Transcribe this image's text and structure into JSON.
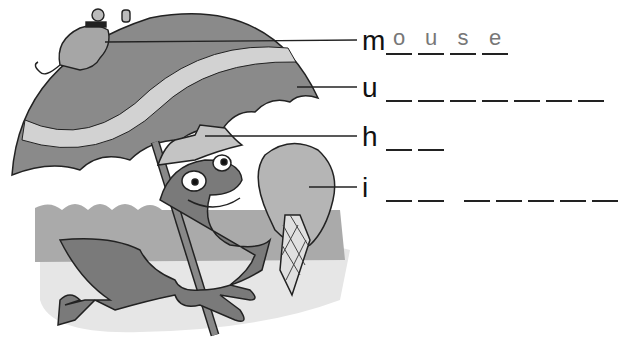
{
  "worksheet": {
    "rows": [
      {
        "id": "mouse",
        "letter": "m",
        "blanks": [
          "o",
          "u",
          "s",
          "e"
        ],
        "word_groups": [
          4
        ],
        "line_y": 40
      },
      {
        "id": "umbrella",
        "letter": "u",
        "blanks": [
          "",
          "",
          "",
          "",
          "",
          "",
          ""
        ],
        "word_groups": [
          7
        ],
        "line_y": 87
      },
      {
        "id": "hat",
        "letter": "h",
        "blanks": [
          "",
          ""
        ],
        "word_groups": [
          2
        ],
        "line_y": 136
      },
      {
        "id": "ice-cream",
        "letter": "i",
        "blanks": [
          "",
          "",
          "",
          "",
          "",
          "",
          ""
        ],
        "word_groups": [
          2,
          5
        ],
        "line_y": 187
      }
    ]
  },
  "illustration": {
    "subjects": [
      "mouse",
      "umbrella",
      "frog",
      "hat",
      "ice-cream",
      "waves",
      "sand"
    ],
    "colors": {
      "umbrella": "#8a8a8a",
      "stripe": "#d2d2d2",
      "frog": "#7a7a7a",
      "hat": "#c4c4c4",
      "icecream": "#b5b5b5",
      "wave": "#a9a9a9",
      "sand": "#e4e4e4",
      "outline": "#222222"
    }
  }
}
